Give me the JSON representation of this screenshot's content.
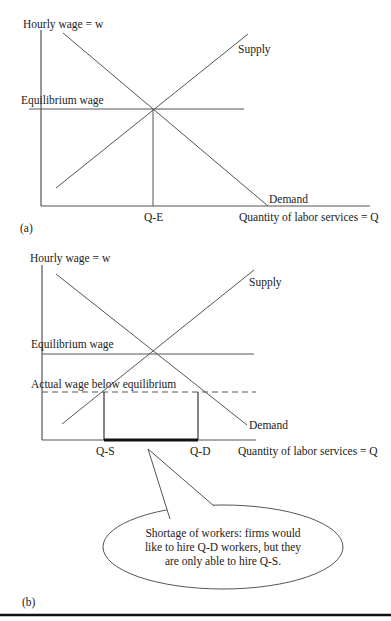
{
  "panel_a": {
    "caption": "(a)",
    "y_axis_label": "Hourly wage = w",
    "x_axis_label": "Quantity of labor services = Q",
    "equilibrium_wage_label": "Equilibrium wage",
    "supply_label": "Supply",
    "demand_label": "Demand",
    "equilibrium_quantity_label": "Q-E"
  },
  "panel_b": {
    "caption": "(b)",
    "y_axis_label": "Hourly wage = w",
    "x_axis_label": "Quantity of labor services = Q",
    "equilibrium_wage_label": "Equilibrium wage",
    "actual_wage_label": "Actual wage below equilibrium",
    "supply_label": "Supply",
    "demand_label": "Demand",
    "quantity_supplied_label": "Q-S",
    "quantity_demanded_label": "Q-D",
    "callout": {
      "line1": "Shortage of workers: firms would",
      "line2": "like to hire Q-D workers, but they",
      "line3": "are only able to hire Q-S."
    }
  },
  "colors": {
    "line": "#555555",
    "text": "#222222",
    "shortage_bar": "#111111"
  }
}
